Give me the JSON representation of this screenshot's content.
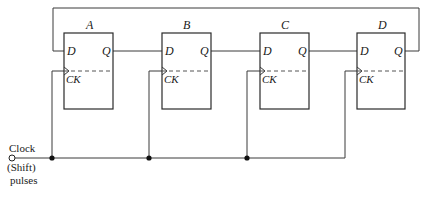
{
  "diagram": {
    "type": "shift-register-ring-counter",
    "flip_flops": [
      {
        "name": "A",
        "d_label": "D",
        "q_label": "Q",
        "ck_label": "CK"
      },
      {
        "name": "B",
        "d_label": "D",
        "q_label": "Q",
        "ck_label": "CK"
      },
      {
        "name": "C",
        "d_label": "D",
        "q_label": "Q",
        "ck_label": "CK"
      },
      {
        "name": "D",
        "d_label": "D",
        "q_label": "Q",
        "ck_label": "CK"
      }
    ],
    "clock_input": {
      "line1": "Clock",
      "line2": "(Shift)",
      "line3": "pulses"
    },
    "connections": [
      "A.Q -> B.D",
      "B.Q -> C.D",
      "C.Q -> D.D",
      "D.Q -> A.D (feedback)",
      "Clock -> A.CK, B.CK, C.CK, D.CK"
    ]
  }
}
